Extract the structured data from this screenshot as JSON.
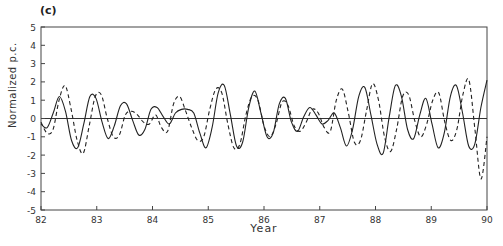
{
  "panel_label": "(c)",
  "chart_data": {
    "type": "line",
    "title": "(c)",
    "xlabel": "Year",
    "ylabel": "Normalized p.c.",
    "xlim": [
      82,
      90
    ],
    "ylim": [
      -5,
      5
    ],
    "xticks": [
      82,
      83,
      84,
      85,
      86,
      87,
      88,
      89,
      90
    ],
    "yticks": [
      5,
      4,
      3,
      2,
      1,
      0,
      -1,
      -2,
      -3,
      -4,
      -5
    ],
    "grid": false,
    "zero_line": true,
    "legend": null,
    "x_step": 0.125,
    "x_start": 82,
    "series": [
      {
        "name": "solid",
        "style": "solid",
        "values": [
          -0.3,
          -0.5,
          0.3,
          1.2,
          0.4,
          -1.2,
          -1.6,
          -0.3,
          1.2,
          1.1,
          -0.2,
          -1.1,
          -0.4,
          0.7,
          0.8,
          -0.1,
          -0.9,
          -0.6,
          0.5,
          0.6,
          0.1,
          -0.3,
          0.3,
          0.5,
          0.5,
          0.3,
          -0.8,
          -1.6,
          -0.5,
          1.4,
          1.8,
          0.2,
          -1.5,
          -1.3,
          0.6,
          1.5,
          0.3,
          -1.0,
          -0.8,
          0.8,
          1.1,
          -0.2,
          -0.7,
          0.1,
          0.6,
          0.2,
          -0.3,
          -0.1,
          0.3,
          -0.5,
          -1.5,
          -0.6,
          1.2,
          1.7,
          0.2,
          -1.4,
          -1.9,
          0.1,
          1.8,
          1.2,
          -0.6,
          -1.1,
          0.2,
          1.1,
          -0.3,
          -1.6,
          -0.8,
          1.2,
          1.8,
          0.3,
          -1.5,
          -1.4,
          0.6,
          2.1
        ]
      },
      {
        "name": "dashed",
        "style": "dashed",
        "values": [
          -0.2,
          -0.8,
          -0.6,
          1.0,
          1.8,
          0.5,
          -1.2,
          -1.9,
          -0.4,
          1.2,
          1.3,
          0.0,
          -1.0,
          -0.9,
          0.2,
          0.4,
          0.2,
          -0.2,
          -0.3,
          0.2,
          -0.5,
          -0.7,
          0.8,
          1.2,
          0.4,
          -0.5,
          -1.2,
          -1.0,
          0.5,
          1.6,
          1.4,
          -0.3,
          -1.6,
          -1.4,
          0.2,
          1.2,
          1.0,
          -0.4,
          -1.0,
          -0.3,
          0.9,
          0.7,
          -0.4,
          -0.7,
          -0.2,
          0.5,
          0.3,
          -0.5,
          -0.7,
          1.0,
          1.6,
          0.3,
          -1.3,
          -1.2,
          0.4,
          1.9,
          1.0,
          -1.0,
          -1.8,
          -0.6,
          1.2,
          1.3,
          -0.1,
          -1.0,
          -0.3,
          1.0,
          1.4,
          -0.2,
          -1.2,
          -0.6,
          1.3,
          2.1,
          -0.6,
          -3.3,
          -1.0
        ]
      }
    ]
  }
}
